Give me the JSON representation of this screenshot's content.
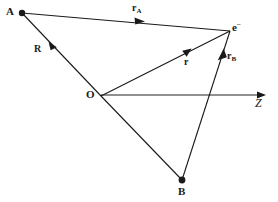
{
  "figure": {
    "background_color": "#ffffff",
    "line_color": "#1a1a1a",
    "axis_color": "#5a5a5a",
    "width": 278,
    "height": 202
  },
  "points": [
    {
      "id": "A",
      "label": "A",
      "x": 22,
      "y": 13,
      "label_x": 6,
      "label_y": 7,
      "has_dot": true
    },
    {
      "id": "e",
      "label": "e",
      "superscript": "–",
      "x": 230,
      "y": 31,
      "label_x": 232,
      "label_y": 21,
      "has_dot": false
    },
    {
      "id": "O",
      "label": "O",
      "x": 101,
      "y": 96,
      "label_x": 86,
      "label_y": 90,
      "has_dot": false
    },
    {
      "id": "B",
      "label": "B",
      "x": 182,
      "y": 180,
      "label_x": 178,
      "label_y": 186,
      "has_dot": true
    }
  ],
  "vectors": [
    {
      "id": "rA",
      "label": "r",
      "subscript": "A",
      "from": "A",
      "to": "e",
      "label_x": 132,
      "label_y": 4,
      "arrow_x": 139,
      "arrow_y": 21
    },
    {
      "id": "R",
      "label": "R",
      "subscript": "",
      "from": "O",
      "to": "A",
      "label_x": 34,
      "label_y": 44,
      "arrow_x": 52,
      "arrow_y": 46
    },
    {
      "id": "r",
      "label": "r",
      "subscript": "",
      "from": "O",
      "to": "e",
      "label_x": 184,
      "label_y": 57,
      "arrow_x": 186,
      "arrow_y": 52
    },
    {
      "id": "rB",
      "label": "r",
      "subscript": "B",
      "from": "B",
      "to": "e",
      "label_x": 227,
      "label_y": 52,
      "arrow_x": 222,
      "arrow_y": 56
    }
  ],
  "plain_lines": [
    {
      "id": "O-B",
      "from": "O",
      "to": "B"
    }
  ],
  "axis": {
    "id": "z-axis",
    "label": "Z",
    "from_x": 101,
    "from_y": 95,
    "to_x": 266,
    "to_y": 95,
    "label_x": 255,
    "label_y": 98
  }
}
